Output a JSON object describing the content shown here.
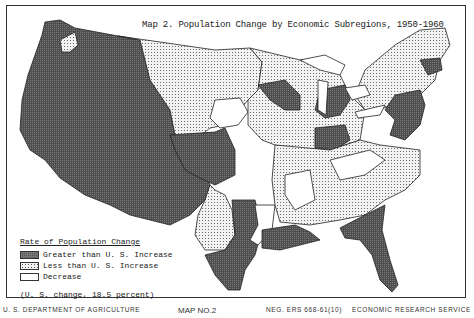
{
  "map": {
    "title": "Map 2.  Population Change by Economic Subregions, 1950-1960",
    "region": "Conterminous United States",
    "legend": {
      "title": "Rate of Population Change",
      "items": [
        {
          "key": "greater",
          "label": "Greater than U. S. Increase",
          "pattern": "dark crosshatch",
          "color": "#555555"
        },
        {
          "key": "less",
          "label": "Less than U. S. Increase",
          "pattern": "light stipple",
          "color": "#eeeeee"
        },
        {
          "key": "decrease",
          "label": "Decrease",
          "pattern": "blank",
          "color": "#ffffff"
        }
      ],
      "note": "(U. S. change, 18.5 percent)"
    }
  },
  "footer": {
    "left": "U. S. DEPARTMENT OF AGRICULTURE",
    "center": "MAP NO.2",
    "neg": "NEG. ERS 668-61(10)",
    "right": "ECONOMIC RESEARCH SERVICE"
  }
}
